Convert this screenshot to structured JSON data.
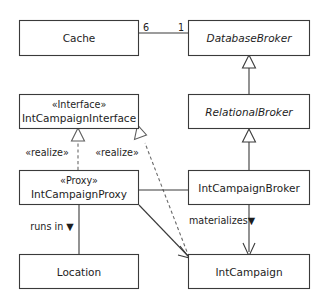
{
  "diagram": {
    "kind": "uml-class-diagram",
    "background_color": "#ffffff",
    "line_color": "#3a3a3a",
    "dashed_line_color": "#5d5d5d",
    "text_color": "#1d1d1d"
  },
  "classes": {
    "cache": {
      "name": "Cache",
      "stereotype": "",
      "italic": false
    },
    "database_broker": {
      "name": "DatabaseBroker",
      "stereotype": "",
      "italic": true
    },
    "int_campaign_interface": {
      "name": "IntCampaignInterface",
      "stereotype": "«Interface»",
      "italic": false
    },
    "relational_broker": {
      "name": "RelationalBroker",
      "stereotype": "",
      "italic": true
    },
    "int_campaign_proxy": {
      "name": "IntCampaignProxy",
      "stereotype": "«Proxy»",
      "italic": false
    },
    "int_campaign_broker": {
      "name": "IntCampaignBroker",
      "stereotype": "",
      "italic": false
    },
    "location": {
      "name": "Location",
      "stereotype": "",
      "italic": false
    },
    "int_campaign": {
      "name": "IntCampaign",
      "stereotype": "",
      "italic": false
    }
  },
  "edges": {
    "cache_to_database_broker": {
      "type": "association",
      "source_multiplicity": "6",
      "target_multiplicity": "1"
    },
    "relational_generalizes_database": {
      "type": "generalization",
      "label": ""
    },
    "broker_generalizes_relational": {
      "type": "generalization",
      "label": ""
    },
    "proxy_realizes_interface": {
      "type": "realization",
      "label": "«realize»"
    },
    "campaign_realizes_interface": {
      "type": "realization",
      "label": "«realize»"
    },
    "proxy_to_broker": {
      "type": "association",
      "label": ""
    },
    "proxy_to_campaign": {
      "type": "association-directed",
      "label": ""
    },
    "proxy_to_location": {
      "type": "association",
      "label": "runs in ▼"
    },
    "broker_to_campaign": {
      "type": "association-directed",
      "label": "materializes▼"
    }
  }
}
